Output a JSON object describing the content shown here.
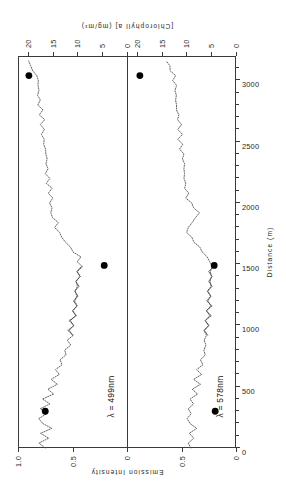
{
  "figure": {
    "orientation": "rotated-90-ccw",
    "background_color": "#ffffff",
    "ink_color": "#1e1e1e"
  },
  "axes": {
    "distance": {
      "title": "Distance  (m)",
      "ticks": [
        "0",
        "500",
        "1000",
        "1500",
        "2000",
        "2500",
        "3000"
      ],
      "tick_values": [
        0,
        500,
        1000,
        1500,
        2000,
        2500,
        3000
      ],
      "minor_step": 100,
      "range": [
        0,
        3200
      ]
    },
    "emission": {
      "title": "Emission  Intensity",
      "panel_top_ticks": [
        "1.0",
        "0.5",
        "0"
      ],
      "panel_bottom_ticks": [
        "0.5",
        "0"
      ],
      "range": [
        0,
        1
      ]
    },
    "chlorophyll": {
      "title": "[Chlorophyll a]   (mg/m³)",
      "panel_top_ticks": [
        "20",
        "15",
        "10",
        "5",
        "0"
      ],
      "panel_bottom_ticks": [
        "20",
        "15",
        "10",
        "5",
        "0"
      ],
      "range": [
        0,
        22
      ]
    }
  },
  "panels": [
    {
      "id": "panel-499",
      "label": "λ = 499nm",
      "wavelength_nm": 499
    },
    {
      "id": "panel-578",
      "label": "λ = 578nm",
      "wavelength_nm": 578
    }
  ],
  "chart_data": {
    "type": "line",
    "title": "",
    "xlabel": "Distance  (m)",
    "ylabel": "Emission  Intensity",
    "y2label": "[Chlorophyll a]   (mg/m³)",
    "xlim": [
      0,
      3200
    ],
    "ylim": [
      0,
      1
    ],
    "y2lim": [
      0,
      22
    ],
    "grid": false,
    "legend": "none",
    "series": [
      {
        "name": "λ = 499nm emission intensity",
        "panel": "panel-499",
        "style": "dotted",
        "x": [
          0,
          40,
          80,
          120,
          160,
          200,
          240,
          280,
          320,
          360,
          400,
          440,
          480,
          520,
          560,
          600,
          640,
          680,
          720,
          760,
          800,
          840,
          880,
          920,
          960,
          1000,
          1040,
          1080,
          1120,
          1160,
          1200,
          1240,
          1280,
          1320,
          1360,
          1400,
          1440,
          1480,
          1520,
          1560,
          1600,
          1640,
          1680,
          1720,
          1760,
          1800,
          1840,
          1880,
          1920,
          1960,
          2000,
          2040,
          2080,
          2120,
          2160,
          2200,
          2240,
          2280,
          2320,
          2360,
          2400,
          2440,
          2480,
          2520,
          2560,
          2600,
          2640,
          2680,
          2720,
          2760,
          2800,
          2840,
          2880,
          2920,
          2960,
          3000,
          3040,
          3080,
          3120,
          3160
        ],
        "y": [
          0.75,
          0.8,
          0.72,
          0.78,
          0.7,
          0.77,
          0.82,
          0.74,
          0.79,
          0.71,
          0.76,
          0.68,
          0.72,
          0.65,
          0.7,
          0.62,
          0.66,
          0.58,
          0.62,
          0.55,
          0.58,
          0.52,
          0.55,
          0.5,
          0.53,
          0.49,
          0.52,
          0.47,
          0.5,
          0.46,
          0.49,
          0.45,
          0.48,
          0.44,
          0.47,
          0.43,
          0.46,
          0.42,
          0.45,
          0.43,
          0.48,
          0.52,
          0.56,
          0.6,
          0.63,
          0.66,
          0.64,
          0.67,
          0.7,
          0.68,
          0.71,
          0.69,
          0.72,
          0.7,
          0.73,
          0.71,
          0.74,
          0.72,
          0.75,
          0.73,
          0.76,
          0.74,
          0.77,
          0.75,
          0.78,
          0.76,
          0.79,
          0.77,
          0.8,
          0.78,
          0.81,
          0.79,
          0.82,
          0.8,
          0.83,
          0.81,
          0.84,
          0.86,
          0.88,
          0.9
        ]
      },
      {
        "name": "λ = 578nm emission intensity",
        "panel": "panel-578",
        "style": "dotted",
        "x": [
          0,
          40,
          80,
          120,
          160,
          200,
          240,
          280,
          320,
          360,
          400,
          440,
          480,
          520,
          560,
          600,
          640,
          680,
          720,
          760,
          800,
          840,
          880,
          920,
          960,
          1000,
          1040,
          1080,
          1120,
          1160,
          1200,
          1240,
          1280,
          1320,
          1360,
          1400,
          1440,
          1480,
          1520,
          1560,
          1600,
          1640,
          1680,
          1720,
          1760,
          1800,
          1840,
          1880,
          1920,
          1960,
          2000,
          2040,
          2080,
          2120,
          2160,
          2200,
          2240,
          2280,
          2320,
          2360,
          2400,
          2440,
          2480,
          2520,
          2560,
          2600,
          2640,
          2680,
          2720,
          2760,
          2800,
          2840,
          2880,
          2920,
          2960,
          3000,
          3040,
          3080,
          3120,
          3160
        ],
        "y": [
          0.4,
          0.44,
          0.38,
          0.43,
          0.37,
          0.42,
          0.46,
          0.4,
          0.44,
          0.38,
          0.42,
          0.36,
          0.4,
          0.34,
          0.38,
          0.32,
          0.35,
          0.3,
          0.33,
          0.28,
          0.31,
          0.27,
          0.3,
          0.26,
          0.29,
          0.25,
          0.28,
          0.24,
          0.27,
          0.23,
          0.26,
          0.23,
          0.26,
          0.22,
          0.25,
          0.22,
          0.25,
          0.21,
          0.24,
          0.26,
          0.3,
          0.34,
          0.38,
          0.42,
          0.45,
          0.44,
          0.4,
          0.36,
          0.34,
          0.38,
          0.42,
          0.46,
          0.44,
          0.47,
          0.45,
          0.48,
          0.46,
          0.49,
          0.47,
          0.5,
          0.48,
          0.51,
          0.49,
          0.52,
          0.5,
          0.53,
          0.51,
          0.54,
          0.52,
          0.55,
          0.53,
          0.56,
          0.54,
          0.57,
          0.55,
          0.58,
          0.56,
          0.59,
          0.61,
          0.63
        ]
      }
    ],
    "markers": [
      {
        "panel": "panel-499",
        "label": "chlorophyll-sample",
        "distance_m": 300,
        "chlorophyll": 16.5
      },
      {
        "panel": "panel-499",
        "label": "chlorophyll-sample",
        "distance_m": 1490,
        "chlorophyll": 4.6
      },
      {
        "panel": "panel-499",
        "label": "chlorophyll-sample",
        "distance_m": 3040,
        "chlorophyll": 19.8
      },
      {
        "panel": "panel-578",
        "label": "chlorophyll-sample",
        "distance_m": 300,
        "chlorophyll": 4.2
      },
      {
        "panel": "panel-578",
        "label": "chlorophyll-sample",
        "distance_m": 1490,
        "chlorophyll": 4.4
      },
      {
        "panel": "panel-578",
        "label": "chlorophyll-sample",
        "distance_m": 3040,
        "chlorophyll": 19.4
      }
    ]
  }
}
